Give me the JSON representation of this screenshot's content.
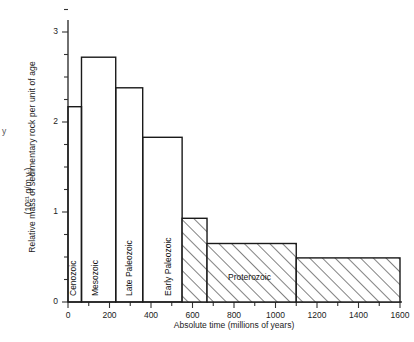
{
  "figure": {
    "axes": {
      "y_title_line1": "Relative mass of sedimentary rock per unit of age",
      "y_title_line2": "(10²¹ g/m.y.)",
      "x_title": "Absolute time (millions of years)",
      "y_tick_labels": [
        "0",
        "1",
        "2",
        "3"
      ],
      "x_tick_labels": [
        "0",
        "200",
        "400",
        "600",
        "800",
        "1000",
        "1200",
        "1400",
        "1600"
      ],
      "stray_mark": "y"
    },
    "bar_labels": [
      {
        "text": "Cenozoic",
        "orientation": "vertical"
      },
      {
        "text": "Mesozoic",
        "orientation": "vertical"
      },
      {
        "text": "Late Paleozoic",
        "orientation": "vertical"
      },
      {
        "text": "Early Paleozoic",
        "orientation": "vertical"
      },
      {
        "text": "Proterozoic",
        "orientation": "horizontal"
      }
    ],
    "colors": {
      "axis": "#333333",
      "bar_outline": "#1a1a1a",
      "hatch": "#1a1a1a",
      "background": "#ffffff"
    }
  },
  "chart_data": {
    "type": "bar",
    "title": "",
    "xlabel": "Absolute time (millions of years)",
    "ylabel": "Relative mass of sedimentary rock per unit of age (10^21 g/m.y.)",
    "xlim": [
      0,
      1600
    ],
    "ylim": [
      0,
      3.2
    ],
    "x_ticks": [
      0,
      200,
      400,
      600,
      800,
      1000,
      1200,
      1400,
      1600
    ],
    "x_minor_tick_step": 100,
    "y_ticks": [
      0,
      1,
      2,
      3
    ],
    "y_minor_tick_step": 0.25,
    "grid": false,
    "legend": "none",
    "orientation": "vertical",
    "note": "Variable-width histogram; each bar spans a geologic time interval.",
    "bars": [
      {
        "label": "Cenozoic",
        "x_start": 0,
        "x_end": 65,
        "value": 2.17,
        "fill": "none"
      },
      {
        "label": "Mesozoic",
        "x_start": 65,
        "x_end": 230,
        "value": 2.72,
        "fill": "none"
      },
      {
        "label": "Late Paleozoic",
        "x_start": 230,
        "x_end": 360,
        "value": 2.38,
        "fill": "none"
      },
      {
        "label": "Early Paleozoic",
        "x_start": 360,
        "x_end": 550,
        "value": 1.83,
        "fill": "none"
      },
      {
        "label": "Proterozoic",
        "x_start": 550,
        "x_end": 670,
        "value": 0.93,
        "fill": "hatched"
      },
      {
        "label": "Proterozoic",
        "x_start": 670,
        "x_end": 1100,
        "value": 0.65,
        "fill": "hatched"
      },
      {
        "label": "Proterozoic",
        "x_start": 1100,
        "x_end": 1600,
        "value": 0.49,
        "fill": "hatched"
      }
    ]
  }
}
